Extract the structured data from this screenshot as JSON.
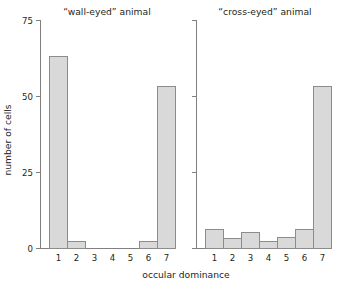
{
  "chart_data": {
    "type": "bar",
    "title": "",
    "xlabel": "occular dominance",
    "ylabel": "number of cells",
    "ylim": [
      0,
      75
    ],
    "yticks": [
      0,
      25,
      50,
      75
    ],
    "ytick_labels": [
      "0",
      "25",
      "50",
      "75"
    ],
    "categories": [
      "1",
      "2",
      "3",
      "4",
      "5",
      "6",
      "7"
    ],
    "grid": false,
    "legend": "none",
    "bar_fill": "#d9d9d9",
    "bar_edge": "#8c8c8c",
    "panels": [
      {
        "title": "“wall-eyed” animal",
        "values": [
          63,
          2,
          0,
          0,
          0,
          2,
          53
        ],
        "ytick_labels_visible": true
      },
      {
        "title": "“cross-eyed” animal",
        "values": [
          6,
          3,
          5,
          2,
          3.5,
          6,
          53
        ],
        "ytick_labels_visible": false
      }
    ]
  },
  "axis": {
    "ylabel": "number of cells",
    "xlabel": "occular dominance",
    "ytick_labels": [
      "75",
      "50",
      "25",
      "0"
    ],
    "xtick_labels": [
      "1",
      "2",
      "3",
      "4",
      "5",
      "6",
      "7"
    ]
  },
  "panel_titles": {
    "left": "“wall-eyed” animal",
    "right": "“cross-eyed” animal"
  }
}
